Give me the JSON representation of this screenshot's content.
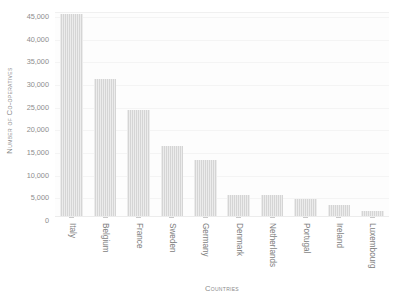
{
  "chart_data": {
    "type": "bar",
    "title": "",
    "xlabel": "Countries",
    "ylabel": "Number of Co-operatives",
    "categories": [
      "Italy",
      "Belgium",
      "France",
      "Sweden",
      "Germany",
      "Denmark",
      "Netherlands",
      "Portugal",
      "Ireland",
      "Luxembourg"
    ],
    "values": [
      43800,
      29600,
      22800,
      14700,
      11800,
      4000,
      3900,
      3000,
      1700,
      400
    ],
    "ylim": [
      0,
      45000
    ],
    "yticks": [
      0,
      5000,
      10000,
      15000,
      20000,
      25000,
      30000,
      35000,
      40000,
      45000
    ],
    "ytick_labels": [
      "0",
      "5,000",
      "10,000",
      "15,000",
      "20,000",
      "25,000",
      "30,000",
      "35,000",
      "40,000",
      "45,000"
    ],
    "grid": true,
    "legend": null,
    "bar_color": "#d5d5d5",
    "background_color": "#fdfdfd",
    "text_color": "#8a8a8a"
  }
}
